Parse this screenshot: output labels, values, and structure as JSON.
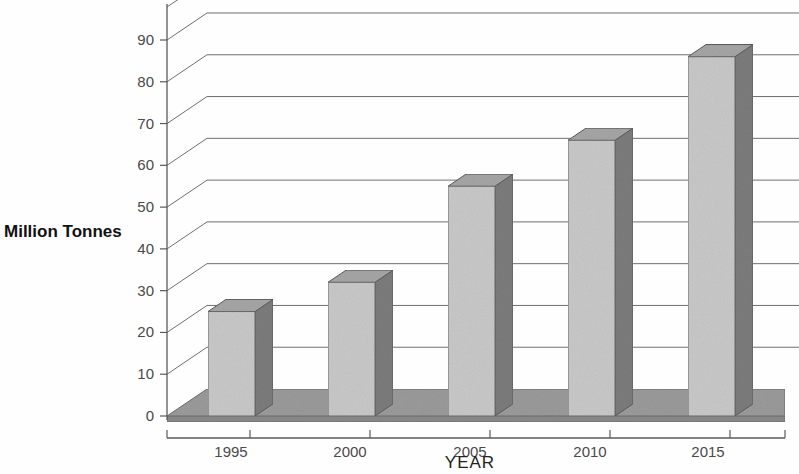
{
  "chart_data": {
    "type": "bar",
    "title": "",
    "subtitle": "",
    "xlabel": "YEAR",
    "ylabel": "Million Tonnes",
    "categories": [
      "1995",
      "2000",
      "2005",
      "2010",
      "2015"
    ],
    "values": [
      25,
      32,
      55,
      66,
      86
    ],
    "series": [
      {
        "name": "Million Tonnes",
        "values": [
          25,
          32,
          55,
          66,
          86
        ]
      }
    ],
    "ylim": [
      0,
      90
    ],
    "ytick_labels": [
      "0",
      "10",
      "20",
      "30",
      "40",
      "50",
      "60",
      "70",
      "80",
      "90"
    ],
    "ytick_values": [
      0,
      10,
      20,
      30,
      40,
      50,
      60,
      70,
      80,
      90
    ],
    "xtick_labels": [
      "1995",
      "2000",
      "2005",
      "2010",
      "2015"
    ],
    "grid": true,
    "legend": "none",
    "style": "3d-perspective-bar",
    "colors": {
      "bar_front": "#c9c9c9",
      "bar_side": "#7d7d7d",
      "bar_top": "#a6a6a6",
      "floor": "#9b9b9b",
      "gridline": "#6f6f6f",
      "axis": "#5a5a5a",
      "background": "#ffffff",
      "text": "#222222"
    }
  },
  "axes": {
    "y_axis_title": "Million Tonnes",
    "x_axis_title": "YEAR"
  },
  "ticks": {
    "y": [
      {
        "label": "90",
        "value": 90
      },
      {
        "label": "80",
        "value": 80
      },
      {
        "label": "70",
        "value": 70
      },
      {
        "label": "60",
        "value": 60
      },
      {
        "label": "50",
        "value": 50
      },
      {
        "label": "40",
        "value": 40
      },
      {
        "label": "30",
        "value": 30
      },
      {
        "label": "20",
        "value": 20
      },
      {
        "label": "10",
        "value": 10
      },
      {
        "label": "0",
        "value": 0
      }
    ],
    "x": [
      {
        "label": "1995",
        "value": 25
      },
      {
        "label": "2000",
        "value": 32
      },
      {
        "label": "2005",
        "value": 55
      },
      {
        "label": "2010",
        "value": 66
      },
      {
        "label": "2015",
        "value": 86
      }
    ]
  }
}
